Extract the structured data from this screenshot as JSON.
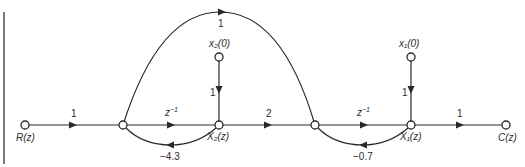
{
  "diagram": {
    "type": "signal-flow-graph",
    "nodes": {
      "R": {
        "label": "R(z)"
      },
      "A": {
        "label": ""
      },
      "X2": {
        "label": "X₂(z)"
      },
      "B": {
        "label": ""
      },
      "X1": {
        "label": "X₁(z)"
      },
      "C": {
        "label": "C(z)"
      },
      "x20": {
        "label": "x₂(0)"
      },
      "x10": {
        "label": "x₁(0)"
      }
    },
    "edges": [
      {
        "from": "R",
        "to": "A",
        "gain": "1"
      },
      {
        "from": "A",
        "to": "X2",
        "gain": "z⁻¹"
      },
      {
        "from": "X2",
        "to": "A",
        "gain": "−4.3"
      },
      {
        "from": "x20",
        "to": "X2",
        "gain": "1"
      },
      {
        "from": "X2",
        "to": "B",
        "gain": "2"
      },
      {
        "from": "A",
        "to": "B",
        "gain": "1"
      },
      {
        "from": "B",
        "to": "X1",
        "gain": "z⁻¹"
      },
      {
        "from": "X1",
        "to": "B",
        "gain": "−0.7"
      },
      {
        "from": "x10",
        "to": "X1",
        "gain": "1"
      },
      {
        "from": "X1",
        "to": "C",
        "gain": "1"
      }
    ],
    "colors": {
      "line": "#2a2a2a",
      "background": "#ffffff"
    }
  }
}
